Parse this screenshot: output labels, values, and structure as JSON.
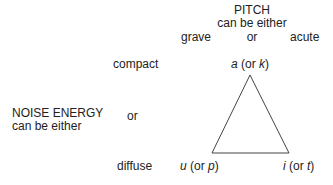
{
  "pitch": {
    "title": "PITCH",
    "subtitle": "can be either",
    "left": "grave",
    "middle": "or",
    "right": "acute"
  },
  "noise": {
    "title": "NOISE ENERGY",
    "subtitle": "can be either",
    "top": "compact",
    "middle": "or",
    "bottom": "diffuse"
  },
  "vertices": {
    "top": {
      "vowel": "a",
      "open": " (or ",
      "cons": "k",
      "close": ")"
    },
    "left": {
      "vowel": "u",
      "open": " (or ",
      "cons": "p",
      "close": ")"
    },
    "right": {
      "vowel": "i",
      "open": " (or ",
      "cons": "t",
      "close": ")"
    }
  },
  "triangle": {
    "stroke": "#444444",
    "points": "250,75 212,153 289,153"
  }
}
